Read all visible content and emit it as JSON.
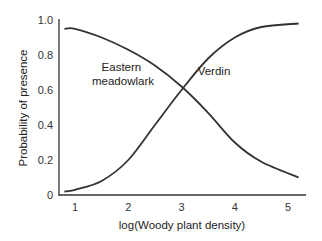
{
  "chart_data": {
    "type": "line",
    "title": "",
    "xlabel": "log(Woody plant density)",
    "ylabel": "Probability of presence",
    "xlim": [
      0.75,
      5.3
    ],
    "ylim": [
      0,
      1.0
    ],
    "x_ticks": [
      1,
      2,
      3,
      4,
      5
    ],
    "x_tick_labels": [
      "1",
      "2",
      "3",
      "4",
      "5"
    ],
    "y_ticks": [
      0,
      0.2,
      0.4,
      0.6,
      0.8,
      1.0
    ],
    "y_tick_labels": [
      "0",
      "0.2",
      "0.4",
      "0.6",
      "0.8",
      "1.0"
    ],
    "grid": false,
    "legend": "none (curves labeled inline)",
    "series": [
      {
        "name": "Eastern meadowlark",
        "label_lines": [
          "Eastern",
          "meadowlark"
        ],
        "x": [
          0.8,
          1.0,
          1.5,
          2.0,
          2.5,
          3.0,
          3.5,
          4.0,
          4.5,
          5.2
        ],
        "values": [
          0.95,
          0.95,
          0.9,
          0.83,
          0.74,
          0.62,
          0.47,
          0.3,
          0.19,
          0.1
        ]
      },
      {
        "name": "Verdin",
        "label_lines": [
          "Verdin"
        ],
        "x": [
          0.8,
          1.0,
          1.5,
          2.0,
          2.5,
          3.0,
          3.5,
          4.0,
          4.5,
          5.2
        ],
        "values": [
          0.02,
          0.03,
          0.08,
          0.2,
          0.4,
          0.6,
          0.78,
          0.9,
          0.96,
          0.98
        ]
      }
    ],
    "annotations": [
      {
        "text": "Eastern meadowlark",
        "near": {
          "x": 1.8,
          "y": 0.7
        }
      },
      {
        "text": "Verdin",
        "near": {
          "x": 3.6,
          "y": 0.74
        }
      }
    ]
  },
  "colors": {
    "curve": "#333333",
    "axis": "#333333",
    "text": "#222222",
    "background": "#ffffff"
  }
}
